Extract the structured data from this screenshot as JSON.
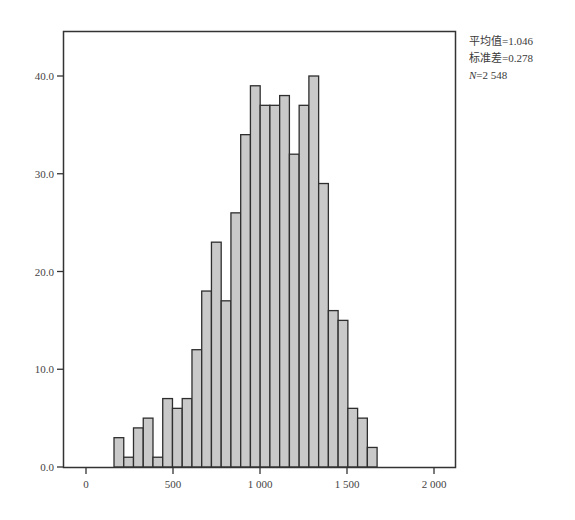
{
  "chart_data": {
    "type": "bar",
    "subtype": "histogram",
    "title": "",
    "xlabel": "",
    "ylabel": "",
    "bin_start": 161,
    "bin_width": 56,
    "values": [
      3,
      1,
      4,
      5,
      1,
      7,
      6,
      7,
      12,
      18,
      23,
      17,
      26,
      34,
      39,
      37,
      37,
      38,
      32,
      37,
      40,
      29,
      16,
      15,
      6,
      5,
      2
    ],
    "xlim": [
      -130,
      2100
    ],
    "ylim": [
      0,
      44.5
    ],
    "x_ticks": [
      0,
      500,
      1000,
      1500,
      2000
    ],
    "x_tick_labels": [
      "0",
      "500",
      "1 000",
      "1 500",
      "2 000"
    ],
    "y_ticks": [
      0,
      10,
      20,
      30,
      40
    ],
    "y_tick_labels": [
      "0.0",
      "10.0",
      "20.0",
      "30.0",
      "40.0"
    ],
    "grid": false,
    "legend": null,
    "annotations": {
      "mean_label": "平均值=1.046",
      "std_label": "标准差=0.278",
      "n_label_prefix": "N",
      "n_label_value": "=2 548"
    },
    "colors": {
      "bar_fill": "#c9c9c9",
      "bar_edge": "#2e2e2e",
      "axis": "#333333"
    }
  }
}
